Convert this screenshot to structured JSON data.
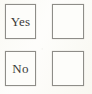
{
  "document": {
    "type": "scanned-form-fragment",
    "background_color": "#fbfaf6",
    "border_color": "#8e8d88",
    "text_color": "#3a3a38",
    "box_fill_color": "#fdfdfa"
  },
  "question": {
    "options": [
      {
        "id": "yes",
        "label": "Yes",
        "label_box_name": "label-box-yes",
        "checkbox_name": "checkbox-yes",
        "checked": false,
        "check_glyph": ""
      },
      {
        "id": "no",
        "label": "No",
        "label_box_name": "label-box-no",
        "checkbox_name": "checkbox-no",
        "checked": false,
        "check_glyph": ""
      }
    ]
  }
}
